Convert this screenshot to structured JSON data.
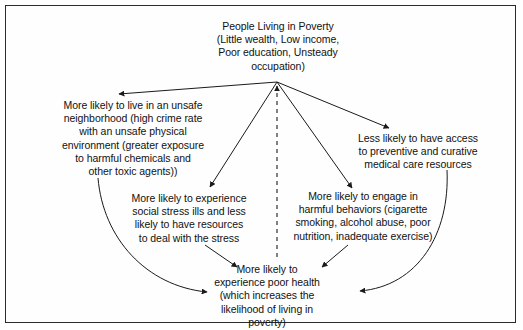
{
  "diagram": {
    "stroke_color": "#1a1a1a",
    "text_color": "#111111",
    "border_color": "#2b2b2b",
    "background_color": "#ffffff",
    "nodes": {
      "poverty": "People Living in Poverty\n(Little wealth, Low income,\nPoor education, Unsteady\noccupation)",
      "neighborhood": "More likely to live in an unsafe\nneighborhood (high crime rate\nwith an unsafe physical\nenvironment (greater exposure\nto harmful chemicals and\nother toxic agents))",
      "access": "Less likely to have access\nto preventive and curative\nmedical care resources",
      "stress": "More likely to experience\nsocial stress ills and less\nlikely to have resources\nto deal with the stress",
      "behaviors": "More likely to engage in\nharmful behaviors (cigarette\nsmoking, alcohol abuse, poor\nnutrition, inadequate exercise)",
      "health": "More likely to\nexperience poor health\n(which increases the\nlikelihood of living in\npoverty)"
    },
    "edges": [
      {
        "from": "poverty",
        "to": "neighborhood",
        "style": "solid",
        "arrowhead": "left"
      },
      {
        "from": "poverty",
        "to": "access",
        "style": "solid",
        "arrowhead": "down-right"
      },
      {
        "from": "poverty",
        "to": "stress",
        "style": "solid",
        "arrowhead": "down-left"
      },
      {
        "from": "poverty",
        "to": "behaviors",
        "style": "solid",
        "arrowhead": "down-right"
      },
      {
        "from": "neighborhood",
        "to": "health",
        "style": "curved",
        "arrowhead": "right"
      },
      {
        "from": "stress",
        "to": "health",
        "style": "solid",
        "arrowhead": "down-right"
      },
      {
        "from": "behaviors",
        "to": "health",
        "style": "solid",
        "arrowhead": "down-left"
      },
      {
        "from": "access",
        "to": "health",
        "style": "curved",
        "arrowhead": "left"
      },
      {
        "from": "health",
        "to": "poverty",
        "style": "dashed",
        "arrowhead": "up"
      }
    ]
  }
}
